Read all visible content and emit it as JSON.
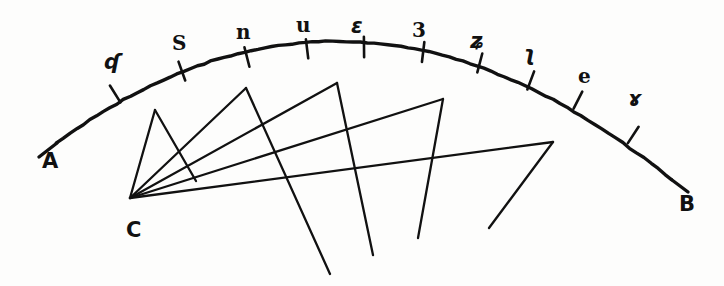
{
  "figure": {
    "ink_color": "#111111",
    "background_color": "#fdfdfc",
    "endpoints": [
      {
        "name": "point-a",
        "label": "A",
        "x": 42,
        "y": 151
      },
      {
        "name": "point-b",
        "label": "B",
        "x": 679,
        "y": 194
      },
      {
        "name": "point-c",
        "label": "C",
        "x": 126,
        "y": 220
      }
    ],
    "arc": {
      "name": "arc-ab",
      "start": {
        "x": 57,
        "y": 143
      },
      "end": {
        "x": 672,
        "y": 180
      },
      "apex": {
        "x": 360,
        "y": 42
      },
      "tick_count": 10
    },
    "ticks": [
      {
        "index": 1,
        "label": "ʠ",
        "x": 115,
        "y": 94,
        "angle": -31,
        "label_x": 104,
        "label_y": 52
      },
      {
        "index": 2,
        "label": "S",
        "x": 182,
        "y": 71,
        "angle": -22,
        "label_x": 172,
        "label_y": 33
      },
      {
        "index": 3,
        "label": "n",
        "x": 247,
        "y": 57,
        "angle": -14,
        "label_x": 236,
        "label_y": 22
      },
      {
        "index": 4,
        "label": "u",
        "x": 307,
        "y": 49,
        "angle": -8,
        "label_x": 296,
        "label_y": 15
      },
      {
        "index": 5,
        "label": "ε",
        "x": 364,
        "y": 47,
        "angle": -1,
        "label_x": 351,
        "label_y": 16
      },
      {
        "index": 6,
        "label": "3",
        "x": 423,
        "y": 52,
        "angle": 7,
        "label_x": 412,
        "label_y": 20
      },
      {
        "index": 7,
        "label": "ʑ",
        "x": 480,
        "y": 63,
        "angle": 14,
        "label_x": 470,
        "label_y": 31
      },
      {
        "index": 8,
        "label": "ʅ",
        "x": 531,
        "y": 80,
        "angle": 21,
        "label_x": 523,
        "label_y": 44
      },
      {
        "index": 9,
        "label": "e",
        "x": 578,
        "y": 100,
        "angle": 27,
        "label_x": 578,
        "label_y": 66
      },
      {
        "index": 10,
        "label": "ɤ",
        "x": 633,
        "y": 135,
        "angle": 35,
        "label_x": 628,
        "label_y": 89
      }
    ],
    "rays": [
      {
        "name": "ray-1",
        "apex": {
          "x": 155,
          "y": 110
        },
        "tail_end": {
          "x": 196,
          "y": 181
        }
      },
      {
        "name": "ray-2",
        "apex": {
          "x": 246,
          "y": 88
        },
        "tail_end": {
          "x": 330,
          "y": 274
        }
      },
      {
        "name": "ray-3",
        "apex": {
          "x": 337,
          "y": 83
        },
        "tail_end": {
          "x": 373,
          "y": 255
        }
      },
      {
        "name": "ray-4",
        "apex": {
          "x": 443,
          "y": 99
        },
        "tail_end": {
          "x": 418,
          "y": 238
        }
      },
      {
        "name": "ray-5",
        "apex": {
          "x": 553,
          "y": 142
        },
        "tail_end": {
          "x": 489,
          "y": 228
        }
      }
    ]
  }
}
